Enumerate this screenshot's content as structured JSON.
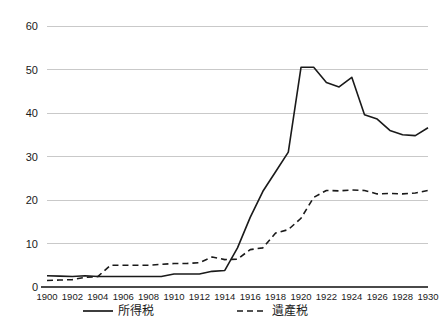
{
  "chart_data": {
    "type": "line",
    "title": "",
    "subtitle": "",
    "xlabel": "",
    "ylabel": "",
    "xlim": [
      1900,
      1930
    ],
    "ylim": [
      0,
      60
    ],
    "y_ticks": [
      0,
      10,
      20,
      30,
      40,
      50,
      60
    ],
    "x_ticks": [
      1900,
      1902,
      1904,
      1906,
      1908,
      1910,
      1912,
      1914,
      1916,
      1918,
      1920,
      1922,
      1924,
      1926,
      1928,
      1930
    ],
    "x": [
      1900,
      1901,
      1902,
      1903,
      1904,
      1905,
      1906,
      1907,
      1908,
      1909,
      1910,
      1911,
      1912,
      1913,
      1914,
      1915,
      1916,
      1917,
      1918,
      1919,
      1920,
      1921,
      1922,
      1923,
      1924,
      1925,
      1926,
      1927,
      1928,
      1929,
      1930
    ],
    "grid": true,
    "grid_axis": "y",
    "legend_position": "bottom",
    "series": [
      {
        "name": "所得税",
        "style": "solid",
        "color": "#1a1a1a",
        "values": [
          2.6,
          2.5,
          2.4,
          2.6,
          2.4,
          2.4,
          2.4,
          2.4,
          2.4,
          2.4,
          3.0,
          3.0,
          3.0,
          3.6,
          3.8,
          9.0,
          16.0,
          22.0,
          26.5,
          31.0,
          50.5,
          50.5,
          47.0,
          46.0,
          48.2,
          39.6,
          38.6,
          36.0,
          35.0,
          34.8,
          36.6
        ]
      },
      {
        "name": "遺產税",
        "style": "dashed",
        "color": "#1a1a1a",
        "values": [
          1.5,
          1.6,
          1.7,
          2.2,
          2.4,
          5.0,
          5.0,
          5.0,
          5.0,
          5.2,
          5.4,
          5.4,
          5.6,
          6.9,
          6.3,
          6.4,
          8.6,
          9.0,
          12.4,
          13.2,
          15.8,
          20.6,
          22.2,
          22.1,
          22.3,
          22.2,
          21.4,
          21.5,
          21.4,
          21.6,
          22.2
        ]
      }
    ],
    "legend": [
      {
        "label": "所得税",
        "style": "solid"
      },
      {
        "label": "遺產税",
        "style": "dashed"
      }
    ]
  },
  "layout": {
    "plot_left": 47,
    "plot_right": 428,
    "plot_top": 26,
    "plot_bottom": 287,
    "legend_y": 315,
    "legend_items_x": [
      83,
      237
    ]
  }
}
